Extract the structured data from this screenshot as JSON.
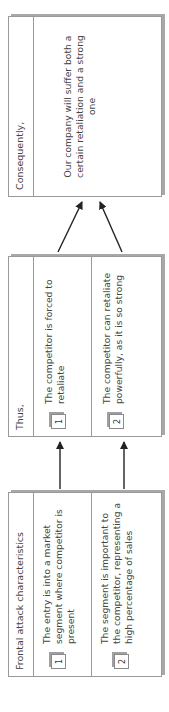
{
  "diagram": {
    "orientation": "rotated -90deg (reads bottom to top)",
    "boxes": [
      {
        "id": "frontal",
        "header": "Frontal attack characteristics",
        "items": [
          {
            "number": "1",
            "text": "The entry is into a market segment where competitor is present"
          },
          {
            "number": "2",
            "text": "The segment is important to the competitor, representing a high percentage of sales"
          }
        ]
      },
      {
        "id": "thus",
        "header": "Thus,",
        "items": [
          {
            "number": "1",
            "text": "The competitor is forced to retaliate"
          },
          {
            "number": "2",
            "text": "The competitor can retaliate powerfully, as it is so strong"
          }
        ]
      },
      {
        "id": "consequently",
        "header": "Consequently,",
        "body": "Our company will suffer both a certain retaliation and a strong one"
      }
    ],
    "arrows": [
      {
        "from": "frontal.1",
        "to": "thus.1"
      },
      {
        "from": "frontal.2",
        "to": "thus.2"
      },
      {
        "from": "thus.1",
        "to": "consequently"
      },
      {
        "from": "thus.2",
        "to": "consequently"
      }
    ],
    "colors": {
      "border": "#9a9a9a",
      "shadow": "#a8a8a8",
      "text": "#444444",
      "arrow": "#222222"
    }
  }
}
